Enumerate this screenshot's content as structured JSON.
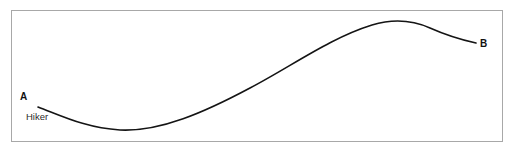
{
  "figure": {
    "type": "line-diagram",
    "background_color": "#ffffff",
    "frame": {
      "border_color": "#a8a8a8",
      "fill_color": "#ffffff"
    },
    "curve": {
      "stroke_color": "#141414",
      "stroke_width": 1.6,
      "description": "smooth S-shaped trail path from A down to a trough, rising to a crest, then descending slightly to B",
      "path": "M 38 107 C 62 116, 86 128, 120 130 C 160 132, 205 112, 250 88 C 292 66, 330 38, 372 25 C 392 19, 412 20, 430 28 C 448 36, 462 40, 476 43",
      "points": [
        {
          "name": "A",
          "x": 38,
          "y": 107
        },
        {
          "name": "trough",
          "x": 120,
          "y": 130
        },
        {
          "name": "inflection",
          "x": 265,
          "y": 80
        },
        {
          "name": "crest",
          "x": 397,
          "y": 20
        },
        {
          "name": "B",
          "x": 476,
          "y": 43
        }
      ]
    },
    "labels": {
      "start_point": "A",
      "end_point": "B",
      "annotation": "Hiker"
    }
  }
}
